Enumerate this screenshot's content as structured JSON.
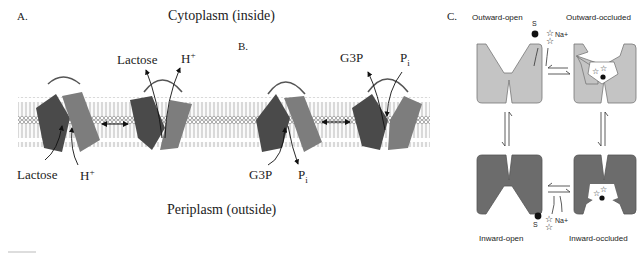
{
  "panels": {
    "A": {
      "label": "A.",
      "compartments": {
        "top": "Cytoplasm (inside)",
        "bottom": "Periplasm (outside)"
      },
      "left_transporter": {
        "substrates_in": [
          "Lactose",
          "H+"
        ]
      },
      "right_transporter": {
        "substrates_out": [
          "Lactose",
          "H+"
        ]
      },
      "lactose": "Lactose",
      "proton": "H",
      "proton_charge": "+"
    },
    "B": {
      "label": "B.",
      "g3p": "G3P",
      "pi_base": "P",
      "pi_sub": "i"
    },
    "C": {
      "label": "C.",
      "states": {
        "outward_open": "Outward-open",
        "outward_occluded": "Outward-occluded",
        "inward_open": "Inward-open",
        "inward_occluded": "Inward-occluded"
      },
      "substrate": "S",
      "ion": "Na+"
    }
  },
  "colors": {
    "dark_domain": "#4a4a4a",
    "light_domain": "#7d7d7d",
    "membrane_head": "#e8e8e8",
    "panel_c_light": "#c4c4c4",
    "panel_c_dark": "#6c6c6c"
  }
}
